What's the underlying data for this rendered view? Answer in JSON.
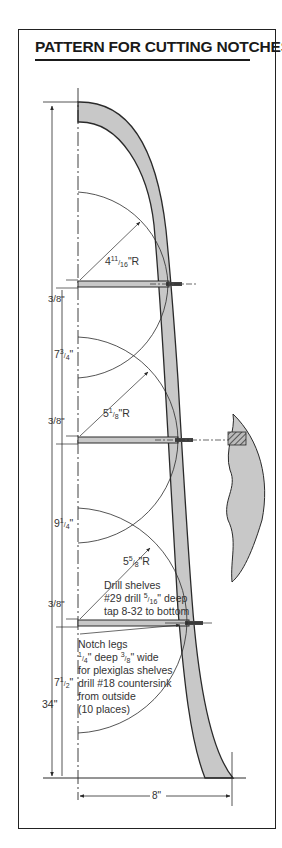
{
  "title": "PATTERN FOR CUTTING NOTCHES",
  "dimensions": {
    "overall_height": "34\"",
    "width": "8\"",
    "shelf_thickness": "3/8\"",
    "spacing_top": "7 3/4\"",
    "spacing_middle": "9 1/4\"",
    "spacing_bottom": "7 1/2\""
  },
  "radii": {
    "top": "4 11/16\"R",
    "middle": "5 1/8\"R",
    "bottom": "5 5/8\"R"
  },
  "notes": {
    "drill_shelves": [
      "Drill shelves",
      "#29 drill 5/16\" deep",
      "tap 8-32 to bottom"
    ],
    "notch_legs": [
      "Notch legs",
      "1/4\" deep 3/8\" wide",
      "for plexiglas shelves",
      "drill #18 countersink",
      "from outside",
      "(10 places)"
    ]
  },
  "labels": {
    "r_top_whole": "4",
    "r_top_num": "11",
    "r_top_den": "16",
    "r_suffix": "\"R",
    "r_mid_whole": "5",
    "r_mid_num": "1",
    "r_mid_den": "8",
    "r_bot_whole": "5",
    "r_bot_num": "5",
    "r_bot_den": "8",
    "frac_38_num": "3",
    "frac_38_den": "8",
    "d1_whole": "7",
    "d1_num": "3",
    "d1_den": "4",
    "d2_whole": "9",
    "d2_num": "1",
    "d2_den": "4",
    "d3_whole": "7",
    "d3_num": "1",
    "d3_den": "2",
    "overall": "34\"",
    "width": "8\"",
    "note_a1": "Drill shelves",
    "note_a2_pre": "#29 drill ",
    "note_a2_num": "5",
    "note_a2_den": "16",
    "note_a2_post": "\" deep",
    "note_a3": "tap 8-32 to bottom",
    "note_b1": "Notch legs",
    "note_b2_n1": "1",
    "note_b2_d1": "4",
    "note_b2_mid": "\" deep ",
    "note_b2_n2": "3",
    "note_b2_d2": "8",
    "note_b2_post": "\" wide",
    "note_b3": "for plexiglas shelves",
    "note_b4": "drill #18 countersink",
    "note_b5": "from outside",
    "note_b6": "(10 places)"
  },
  "colors": {
    "fill": "#c8c8c8",
    "line": "#2a2a2a"
  }
}
